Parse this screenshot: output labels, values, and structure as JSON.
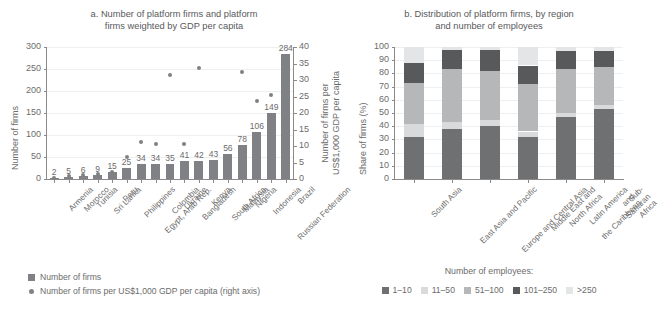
{
  "chart_data": [
    {
      "id": "a",
      "type": "bar",
      "title": "a. Number of platform firms and platform\nfirms weighted by GDP per capita",
      "xlabel": "",
      "ylabel": "Number of firms",
      "y2label": "Number of firms per\nUS$1,000 GDP per capita",
      "ylim": [
        0,
        300
      ],
      "yticks": [
        0,
        50,
        100,
        150,
        200,
        250,
        300
      ],
      "y2lim": [
        0,
        40
      ],
      "y2ticks": [
        0,
        5,
        10,
        15,
        20,
        25,
        30,
        35,
        40
      ],
      "grid": true,
      "legend_position": "bottom-left",
      "categories": [
        "Armenia",
        "Morocco",
        "Tunisia",
        "Sri Lanka",
        "Peru",
        "Philippines",
        "Egypt, Arab Rep.",
        "Colombia",
        "Ukraine",
        "Bangladesh",
        "Kenya",
        "South Africa",
        "Malaysia",
        "Nigeria",
        "Indonesia",
        "Russian Federation",
        "Brazil"
      ],
      "series": [
        {
          "name": "Number of firms",
          "type": "bar",
          "color": "#808184",
          "values": [
            2,
            5,
            6,
            9,
            15,
            25,
            34,
            34,
            35,
            41,
            42,
            43,
            56,
            78,
            106,
            149,
            284
          ],
          "data_labels": [
            "2",
            "5",
            "6",
            "9",
            "15",
            "25",
            "34",
            "34",
            "35",
            "41",
            "42",
            "43",
            "56",
            "78",
            "106",
            "149",
            "284"
          ]
        },
        {
          "name": "Number of firms per US$1,000 GDP per capita (right axis)",
          "type": "scatter",
          "color": "#808184",
          "axis": "right",
          "values": [
            0.4,
            0.9,
            1.1,
            1.6,
            2.1,
            6.6,
            11.1,
            10.5,
            31.5,
            10.7,
            33.5,
            2.2,
            1.9,
            32.4,
            23.5,
            25.6,
            11.6
          ]
        }
      ]
    },
    {
      "id": "b",
      "type": "bar",
      "stacked": true,
      "title": "b. Distribution of platform firms, by region\nand number of employees",
      "xlabel": "",
      "ylabel": "Share of firms (%)",
      "ylim": [
        0,
        100
      ],
      "yticks": [
        0,
        10,
        20,
        30,
        40,
        50,
        60,
        70,
        80,
        90,
        100
      ],
      "grid": true,
      "legend_title": "Number of employees:",
      "legend_position": "bottom",
      "categories": [
        "South Asia",
        "East Asia and Pacific",
        "Europe and Central Asia",
        "Middle East and\nNorth Africa",
        "Latin America and\nthe Caribbean",
        "Sub-Saharan Africa"
      ],
      "series": [
        {
          "name": "1–10",
          "color": "#6f7072",
          "values": [
            32,
            38,
            40,
            32,
            47,
            53
          ]
        },
        {
          "name": "11–50",
          "color": "#d9dadb",
          "values": [
            10,
            5,
            5,
            4,
            3,
            3
          ]
        },
        {
          "name": "51–100",
          "color": "#b6b7b9",
          "values": [
            31,
            40,
            37,
            36,
            33,
            29
          ]
        },
        {
          "name": "101–250",
          "color": "#58595b",
          "values": [
            15,
            15,
            16,
            14,
            14,
            12
          ]
        },
        {
          "name": ">250",
          "color": "#e4e5e6",
          "values": [
            12,
            2,
            2,
            14,
            3,
            3
          ]
        }
      ]
    }
  ],
  "panel_a": {
    "title": "a. Number of platform firms and platform\nfirms weighted by GDP per capita",
    "y_axis_title": "Number of firms",
    "y2_axis_title": "Number of firms per\nUS$1,000 GDP per capita",
    "legend": [
      {
        "icon": "square-swatch",
        "label": "Number of firms"
      },
      {
        "icon": "circle-dot",
        "label": "Number of firms per US$1,000 GDP per capita (right axis)"
      }
    ]
  },
  "panel_b": {
    "title": "b. Distribution of platform firms, by region\nand number of employees",
    "y_axis_title": "Share of firms (%)",
    "legend_title": "Number of employees:"
  }
}
